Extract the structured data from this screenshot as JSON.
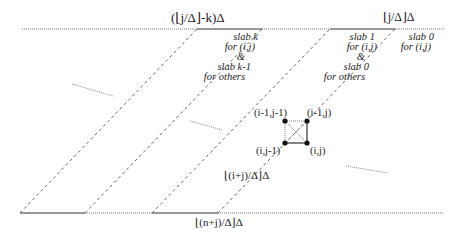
{
  "labels": {
    "top_left_formula": "(⌊j/Δ⌋-k)Δ",
    "top_right_formula": "⌊j/Δ⌋Δ",
    "mid_formula": "⌊(i+j)/Δ⌋Δ",
    "bottom_formula": "⌊(n+j)/Δ⌋Δ",
    "slab_k_text": [
      "slab k",
      "for (i,j)",
      "&",
      "slab k-1",
      "for others"
    ],
    "slab_1_text": [
      "slab 1",
      "for (i,j)",
      "&",
      "slab 0",
      "for others"
    ],
    "slab_0_text": [
      "slab 0",
      "for (i,j)"
    ]
  },
  "nodes": [
    {
      "label": "(i-1,j-1)",
      "x": 285,
      "y": 121
    },
    {
      "label": "(i-1,j)",
      "x": 307,
      "y": 121
    },
    {
      "label": "(i,j-1)",
      "x": 285,
      "y": 143
    },
    {
      "label": "(i,j)",
      "x": 307,
      "y": 143
    }
  ],
  "colors": {
    "line": "#333333",
    "dotted": "#666666",
    "dashed": "#555555"
  }
}
